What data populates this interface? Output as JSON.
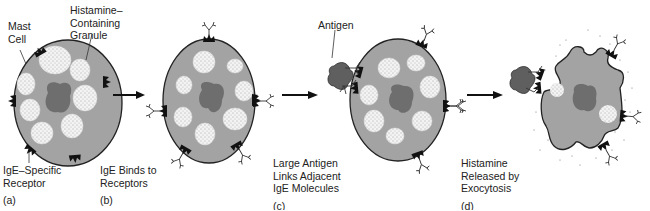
{
  "figure": {
    "type": "mast-cell-degranulation",
    "colors": {
      "cytoplasm": "#a3a3a3",
      "nucleus": "#6e6e6e",
      "granule": "#f2f2f2",
      "outline": "#222222",
      "receptor": "#111111",
      "antigen": "#5f5f5f"
    },
    "panels": [
      {
        "id": "a",
        "caption": "IgE–Specific Receptor",
        "line1": "IgE–Specific",
        "line2": "Receptor",
        "letter": "(a)"
      },
      {
        "id": "b",
        "caption": "IgE Binds to Receptors",
        "line1": "IgE Binds to",
        "line2": "Receptors",
        "letter": "(b)"
      },
      {
        "id": "c",
        "caption": "Large Antigen Links Adjacent IgE Molecules",
        "line1": "Large Antigen",
        "line2": "Links Adjacent",
        "line3": "IgE Molecules",
        "letter": "(c)"
      },
      {
        "id": "d",
        "caption": "Histamine Released by Exocytosis",
        "line1": "Histamine",
        "line2": "Released by",
        "line3": "Exocytosis",
        "letter": "(d)"
      }
    ],
    "callouts": {
      "mast_cell_1": "Mast",
      "mast_cell_2": "Cell",
      "granule_1": "Histamine–",
      "granule_2": "Containing",
      "granule_3": "Granule",
      "antigen": "Antigen"
    },
    "arrows": [
      "a-to-b",
      "b-to-c",
      "c-to-d"
    ]
  }
}
